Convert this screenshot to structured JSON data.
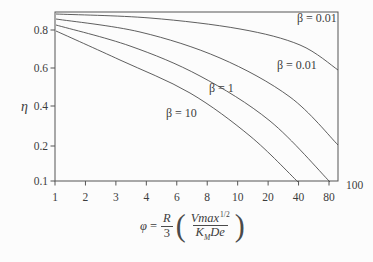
{
  "figure": {
    "background": "#fcfcfc",
    "line_color": "#555555",
    "text_color": "#3c3c3c",
    "formula": {
      "phi": "φ",
      "equals": "=",
      "coef_num": "R",
      "coef_den": "3",
      "open_paren": "(",
      "inner_num": "Vmax",
      "exponent": "1/2",
      "inner_den_k": "K",
      "inner_den_k_sub": "M",
      "inner_den_rest": "De",
      "close_paren": ")"
    }
  },
  "chart_data": {
    "type": "line",
    "title": "",
    "xlabel": "φ = (R/3)(Vmax/(K_M De))^(1/2)",
    "ylabel": "η",
    "x_ticks": [
      "1",
      "2",
      "3",
      "4",
      "6",
      "8",
      "10",
      "20",
      "40",
      "80"
    ],
    "x_end_label": "100",
    "y_ticks": [
      "0.8",
      "0.6",
      "0.4",
      "0.2",
      "0.1"
    ],
    "axis_note": "schematic log-style axis, ticks equally spaced",
    "ylim": [
      0.1,
      0.9
    ],
    "xlim": [
      1,
      100
    ],
    "grid": "off",
    "legend": "inline labels beside curves",
    "series": [
      {
        "name": "beta-0.01-upper",
        "label": "β = 0.01",
        "x": [
          1,
          5,
          18,
          50,
          100
        ],
        "y": [
          0.88,
          0.86,
          0.78,
          0.7,
          0.58
        ]
      },
      {
        "name": "beta-0.01-lower",
        "label": "β = 0.01",
        "x": [
          1,
          4,
          9,
          30,
          100
        ],
        "y": [
          0.86,
          0.79,
          0.65,
          0.45,
          0.2
        ]
      },
      {
        "name": "beta-1",
        "label": "β = 1",
        "x": [
          1,
          3.5,
          7.5,
          20,
          80
        ],
        "y": [
          0.84,
          0.72,
          0.56,
          0.33,
          0.1
        ]
      },
      {
        "name": "beta-10",
        "label": "β = 10",
        "x": [
          1,
          3,
          6.5,
          12,
          40
        ],
        "y": [
          0.8,
          0.64,
          0.47,
          0.26,
          0.1
        ]
      }
    ]
  }
}
